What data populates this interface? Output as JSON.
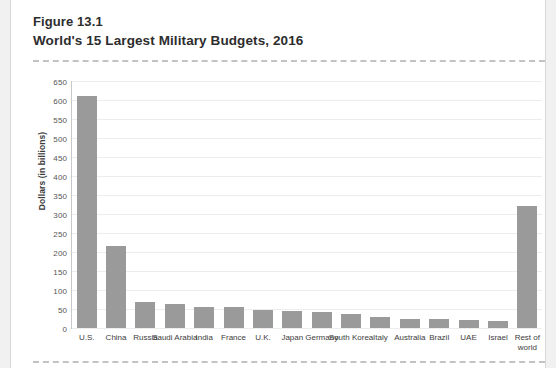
{
  "figure": {
    "number": "Figure 13.1",
    "title": "World's 15 Largest Military Budgets, 2016"
  },
  "colors": {
    "bar": "#9a9a9a",
    "gridline": "#ededed",
    "axis": "#c9c9c9",
    "card": "#ffffff",
    "page_background": "#f1f1f1",
    "dashed_rule": "#c3c3c3",
    "text": "#2d2d2d"
  },
  "chart_data": {
    "type": "bar",
    "title": "World's 15 Largest Military Budgets, 2016",
    "xlabel": "",
    "ylabel": "Dollars (in billions)",
    "ylim": [
      0,
      650
    ],
    "ytick_step": 50,
    "yticks": [
      0,
      50,
      100,
      150,
      200,
      250,
      300,
      350,
      400,
      450,
      500,
      550,
      600,
      650
    ],
    "ytick_labels": [
      "0",
      "50",
      "100",
      "150",
      "200",
      "250",
      "300",
      "350",
      "400",
      "450",
      "500",
      "550",
      "600",
      "650"
    ],
    "grid": true,
    "legend": false,
    "categories": [
      "U.S.",
      "China",
      "Russia",
      "Saudi Arabia",
      "India",
      "France",
      "U.K.",
      "Japan",
      "Germany",
      "South Korea",
      "Italy",
      "Australia",
      "Brazil",
      "UAE",
      "Israel",
      "Rest of world"
    ],
    "values": [
      611,
      215,
      69,
      64,
      56,
      56,
      48,
      46,
      41,
      37,
      28,
      24,
      23,
      22,
      18,
      320
    ]
  }
}
